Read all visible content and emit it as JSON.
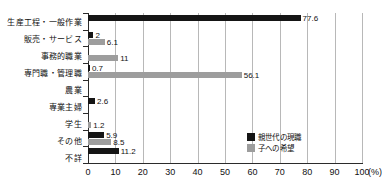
{
  "chart_data": {
    "type": "bar",
    "orientation": "horizontal",
    "grouped": true,
    "title": "",
    "subtitle": "",
    "xlabel": "(%)",
    "ylabel": "",
    "xlim": [
      0,
      100
    ],
    "xticks": [
      "0",
      "10",
      "20",
      "30",
      "40",
      "50",
      "60",
      "70",
      "80",
      "90",
      "100"
    ],
    "x_unit": "(%)",
    "grid": "vertical",
    "legend_position": "bottom-right",
    "categories": [
      "生産工程・一般作業",
      "販売・サービス",
      "事務的職業",
      "専門職・管理職",
      "農業",
      "専業主婦",
      "学生",
      "その他",
      "不詳"
    ],
    "series": [
      {
        "name": "親世代の現職",
        "color": "#151515",
        "values": [
          77.6,
          2,
          0,
          0.7,
          0,
          2.6,
          0,
          5.9,
          11.2
        ],
        "labels": [
          "77.6",
          "2",
          "",
          "0.7",
          "",
          "2.6",
          "",
          "5.9",
          "11.2"
        ]
      },
      {
        "name": "子への希望",
        "color": "#9d9d9d",
        "values": [
          0,
          6.1,
          11,
          56.1,
          0,
          0,
          1.2,
          8.5,
          0
        ],
        "labels": [
          "",
          "6.1",
          "11",
          "56.1",
          "",
          "",
          "1.2",
          "8.5",
          ""
        ]
      }
    ]
  },
  "legend": {
    "items": [
      {
        "label": "親世代の現職",
        "color": "#151515"
      },
      {
        "label": "子への希望",
        "color": "#9d9d9d"
      }
    ]
  }
}
